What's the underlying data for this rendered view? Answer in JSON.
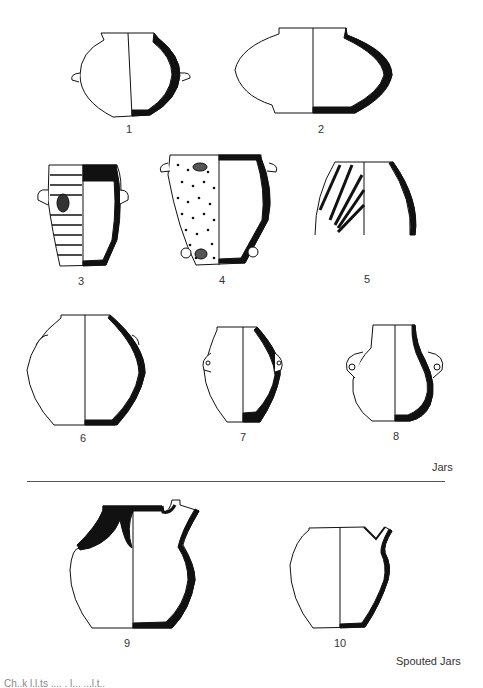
{
  "figure": {
    "sections": [
      {
        "title": "Jars",
        "items": [
          "1",
          "2",
          "3",
          "4",
          "5",
          "6",
          "7",
          "8"
        ]
      },
      {
        "title": "Spouted Jars",
        "items": [
          "9",
          "10"
        ]
      }
    ],
    "labels": {
      "v1": "1",
      "v2": "2",
      "v3": "3",
      "v4": "4",
      "v5": "5",
      "v6": "6",
      "v7": "7",
      "v8": "8",
      "v9": "9",
      "v10": "10"
    },
    "section_jars": "Jars",
    "section_spouted": "Spouted Jars",
    "caption_clipped": "Ch..k  l.l.ts  ....  . l...  ...l.t.."
  }
}
